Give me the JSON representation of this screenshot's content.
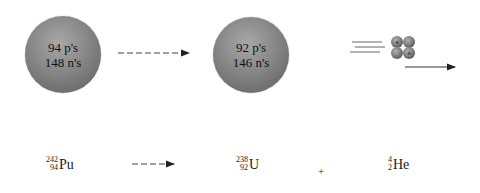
{
  "diagram": {
    "parent_nucleus": {
      "protons_label": "94 p's",
      "neutrons_label": "148 n's",
      "color": "#8e8e8e"
    },
    "daughter_nucleus": {
      "protons_label": "92 p's",
      "neutrons_label": "146 n's",
      "color": "#8e8e8e"
    },
    "alpha_particle": {
      "nucleons": 4,
      "protons": 2,
      "proton_mark": "+"
    },
    "equation": {
      "reactant": {
        "mass": "242",
        "atomic": "94",
        "symbol": "Pu"
      },
      "product1": {
        "mass": "238",
        "atomic": "92",
        "symbol": "U"
      },
      "operator": "+",
      "product2": {
        "mass": "4",
        "atomic": "2",
        "symbol": "He"
      }
    }
  }
}
